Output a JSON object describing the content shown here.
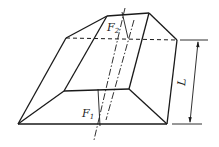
{
  "diagram": {
    "type": "frustum-with-force-lines",
    "labels": {
      "force_top": "F",
      "force_top_sub": "2",
      "force_bottom": "F",
      "force_bottom_sub": "1",
      "dimension": "L"
    },
    "colors": {
      "stroke": "#1a1a1a",
      "background": "#ffffff"
    }
  }
}
